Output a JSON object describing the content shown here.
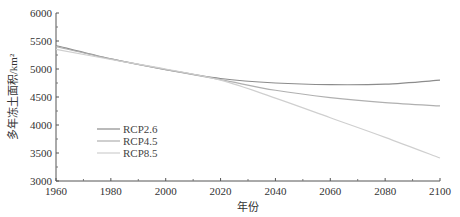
{
  "chart_data": {
    "type": "line",
    "title": "",
    "xlabel": "年份",
    "ylabel": "多年冻土面积/km²",
    "xlim": [
      1960,
      2100
    ],
    "ylim": [
      3000,
      6000
    ],
    "x_ticks": [
      1960,
      1980,
      2000,
      2020,
      2040,
      2060,
      2080,
      2100
    ],
    "y_ticks": [
      3000,
      3500,
      4000,
      4500,
      5000,
      5500,
      6000
    ],
    "grid": false,
    "legend_position": "lower-left-inside",
    "x": [
      1960,
      1980,
      2000,
      2020,
      2040,
      2060,
      2080,
      2100
    ],
    "series": [
      {
        "name": "RCP2.6",
        "color": "#8c8c8c",
        "values": [
          5420,
          5180,
          4990,
          4830,
          4750,
          4720,
          4730,
          4800
        ]
      },
      {
        "name": "RCP4.5",
        "color": "#b0b0b0",
        "values": [
          5400,
          5180,
          4990,
          4810,
          4620,
          4490,
          4400,
          4340
        ]
      },
      {
        "name": "RCP8.5",
        "color": "#cfcfcf",
        "values": [
          5350,
          5170,
          5000,
          4800,
          4480,
          4130,
          3780,
          3410
        ]
      }
    ]
  }
}
